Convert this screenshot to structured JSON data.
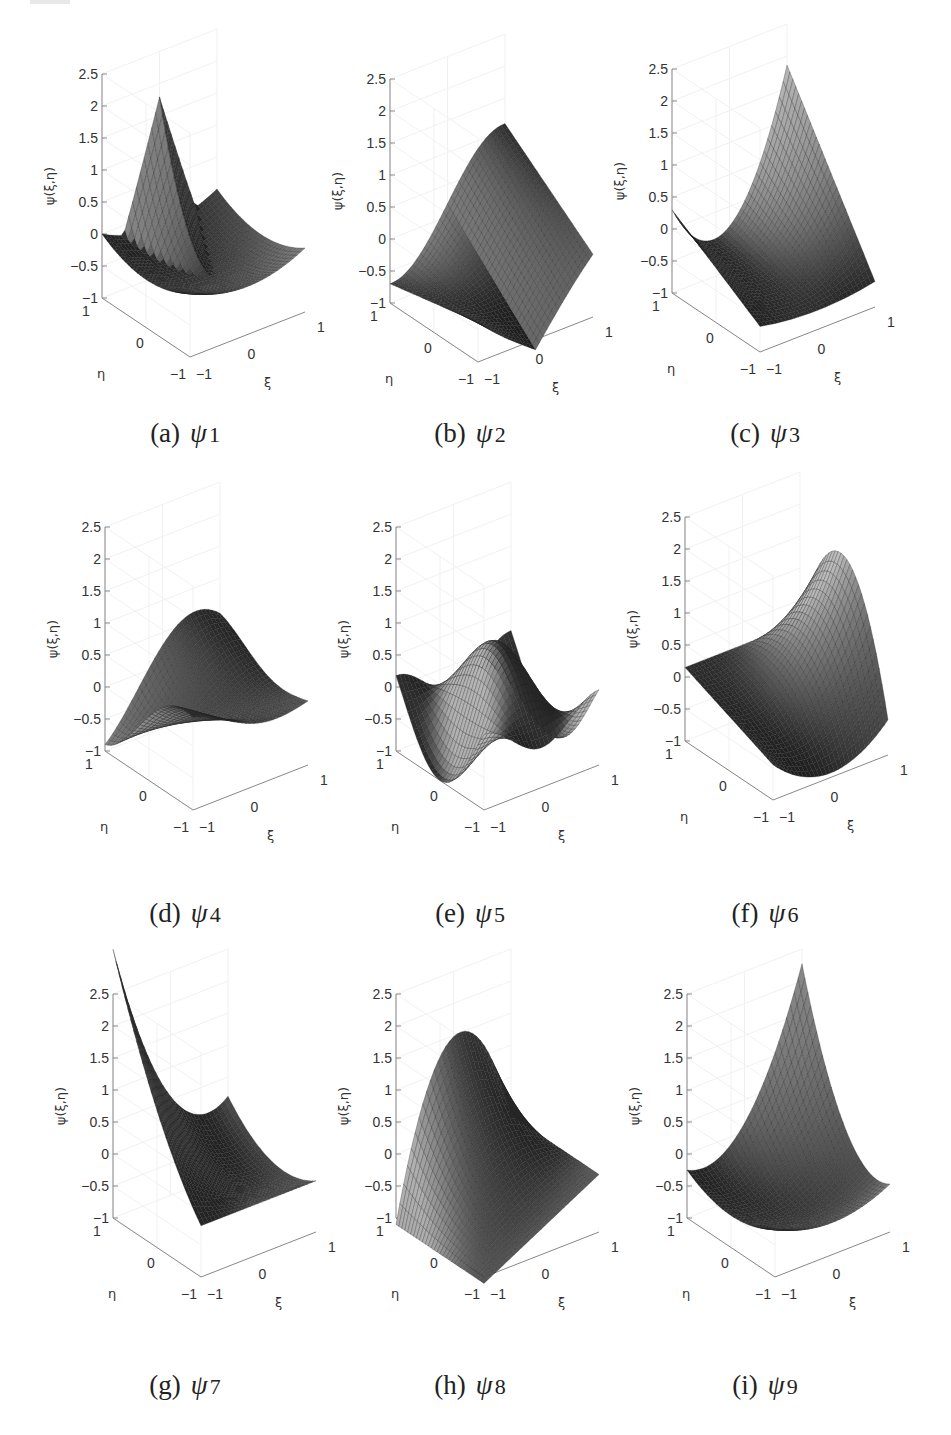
{
  "figure": {
    "z_axis_label": "ψ(ξ,η)",
    "x_axis_label": "ξ",
    "y_axis_label": "η",
    "z_ticks": [
      "2.5",
      "2",
      "1.5",
      "1",
      "0.5",
      "0",
      "−0.5",
      "−1"
    ],
    "x_ticks": [
      "−1",
      "0",
      "1"
    ],
    "y_ticks": [
      "1",
      "0",
      "−1"
    ]
  },
  "panels": [
    {
      "letter": "(a)",
      "psi": "ψ",
      "index": "1"
    },
    {
      "letter": "(b)",
      "psi": "ψ",
      "index": "2"
    },
    {
      "letter": "(c)",
      "psi": "ψ",
      "index": "3"
    },
    {
      "letter": "(d)",
      "psi": "ψ",
      "index": "4"
    },
    {
      "letter": "(e)",
      "psi": "ψ",
      "index": "5"
    },
    {
      "letter": "(f)",
      "psi": "ψ",
      "index": "6"
    },
    {
      "letter": "(g)",
      "psi": "ψ",
      "index": "7"
    },
    {
      "letter": "(h)",
      "psi": "ψ",
      "index": "8"
    },
    {
      "letter": "(i)",
      "psi": "ψ",
      "index": "9"
    }
  ],
  "chart_data": [
    {
      "type": "surface",
      "title": "(a) ψ1",
      "xlabel": "ξ",
      "ylabel": "η",
      "zlabel": "ψ(ξ,η)",
      "xlim": [
        -1,
        1
      ],
      "ylim": [
        -1,
        1
      ],
      "zlim": [
        -1,
        2.5
      ],
      "zticks": [
        -1,
        -0.5,
        0,
        0.5,
        1,
        1.5,
        2,
        2.5
      ],
      "xticks": [
        -1,
        0,
        1
      ],
      "yticks": [
        -1,
        0,
        1
      ],
      "grid": true,
      "approx_max": 1.2,
      "approx_min": -0.6
    },
    {
      "type": "surface",
      "title": "(b) ψ2",
      "xlabel": "ξ",
      "ylabel": "η",
      "zlabel": "ψ(ξ,η)",
      "xlim": [
        -1,
        1
      ],
      "ylim": [
        -1,
        1
      ],
      "zlim": [
        -1,
        2.5
      ],
      "zticks": [
        -1,
        -0.5,
        0,
        0.5,
        1,
        1.5,
        2,
        2.5
      ],
      "xticks": [
        -1,
        0,
        1
      ],
      "yticks": [
        -1,
        0,
        1
      ],
      "grid": true,
      "approx_max": 0.9,
      "approx_min": -1.0
    },
    {
      "type": "surface",
      "title": "(c) ψ3",
      "xlabel": "ξ",
      "ylabel": "η",
      "zlabel": "ψ(ξ,η)",
      "xlim": [
        -1,
        1
      ],
      "ylim": [
        -1,
        1
      ],
      "zlim": [
        -1,
        2.5
      ],
      "zticks": [
        -1,
        -0.5,
        0,
        0.5,
        1,
        1.5,
        2,
        2.5
      ],
      "xticks": [
        -1,
        0,
        1
      ],
      "yticks": [
        -1,
        0,
        1
      ],
      "grid": true,
      "approx_max": 2.0,
      "approx_min": -0.9
    },
    {
      "type": "surface",
      "title": "(d) ψ4",
      "xlabel": "ξ",
      "ylabel": "η",
      "zlabel": "ψ(ξ,η)",
      "xlim": [
        -1,
        1
      ],
      "ylim": [
        -1,
        1
      ],
      "zlim": [
        -1,
        2.5
      ],
      "zticks": [
        -1,
        -0.5,
        0,
        0.5,
        1,
        1.5,
        2,
        2.5
      ],
      "xticks": [
        -1,
        0,
        1
      ],
      "yticks": [
        -1,
        0,
        1
      ],
      "grid": true,
      "approx_max": 1.0,
      "approx_min": -1.0
    },
    {
      "type": "surface",
      "title": "(e) ψ5",
      "xlabel": "ξ",
      "ylabel": "η",
      "zlabel": "ψ(ξ,η)",
      "xlim": [
        -1,
        1
      ],
      "ylim": [
        -1,
        1
      ],
      "zlim": [
        -1,
        2.5
      ],
      "zticks": [
        -1,
        -0.5,
        0,
        0.5,
        1,
        1.5,
        2,
        2.5
      ],
      "xticks": [
        -1,
        0,
        1
      ],
      "yticks": [
        -1,
        0,
        1
      ],
      "grid": true,
      "approx_max": 1.0,
      "approx_min": -1.0
    },
    {
      "type": "surface",
      "title": "(f) ψ6",
      "xlabel": "ξ",
      "ylabel": "η",
      "zlabel": "ψ(ξ,η)",
      "xlim": [
        -1,
        1
      ],
      "ylim": [
        -1,
        1
      ],
      "zlim": [
        -1,
        2.5
      ],
      "zticks": [
        -1,
        -0.5,
        0,
        0.5,
        1,
        1.5,
        2,
        2.5
      ],
      "xticks": [
        -1,
        0,
        1
      ],
      "yticks": [
        -1,
        0,
        1
      ],
      "grid": true,
      "approx_max": 1.8,
      "approx_min": -1.0
    },
    {
      "type": "surface",
      "title": "(g) ψ7",
      "xlabel": "ξ",
      "ylabel": "η",
      "zlabel": "ψ(ξ,η)",
      "xlim": [
        -1,
        1
      ],
      "ylim": [
        -1,
        1
      ],
      "zlim": [
        -1,
        2.5
      ],
      "zticks": [
        -1,
        -0.5,
        0,
        0.5,
        1,
        1.5,
        2,
        2.5
      ],
      "xticks": [
        -1,
        0,
        1
      ],
      "yticks": [
        -1,
        0,
        1
      ],
      "grid": true,
      "approx_max": 2.1,
      "approx_min": -0.9
    },
    {
      "type": "surface",
      "title": "(h) ψ8",
      "xlabel": "ξ",
      "ylabel": "η",
      "zlabel": "ψ(ξ,η)",
      "xlim": [
        -1,
        1
      ],
      "ylim": [
        -1,
        1
      ],
      "zlim": [
        -1,
        2.5
      ],
      "zticks": [
        -1,
        -0.5,
        0,
        0.5,
        1,
        1.5,
        2,
        2.5
      ],
      "xticks": [
        -1,
        0,
        1
      ],
      "yticks": [
        -1,
        0,
        1
      ],
      "grid": true,
      "approx_max": 1.8,
      "approx_min": -1.0
    },
    {
      "type": "surface",
      "title": "(i) ψ9",
      "xlabel": "ξ",
      "ylabel": "η",
      "zlabel": "ψ(ξ,η)",
      "xlim": [
        -1,
        1
      ],
      "ylim": [
        -1,
        1
      ],
      "zlim": [
        -1,
        2.5
      ],
      "zticks": [
        -1,
        -0.5,
        0,
        0.5,
        1,
        1.5,
        2,
        2.5
      ],
      "xticks": [
        -1,
        0,
        1
      ],
      "yticks": [
        -1,
        0,
        1
      ],
      "grid": true,
      "approx_max": 2.8,
      "approx_min": -0.9
    }
  ]
}
